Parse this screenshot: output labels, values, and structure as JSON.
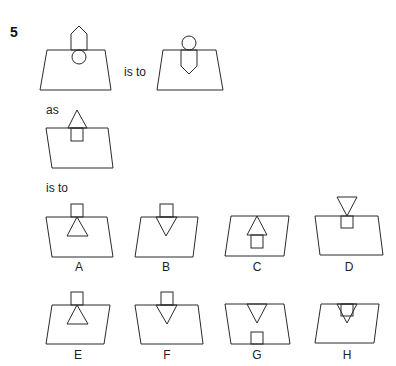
{
  "question": {
    "number": "5",
    "connector_1": "is to",
    "connector_2": "as",
    "connector_3": "is to"
  },
  "figures": {
    "figure_1": {
      "description": "trapezoid with pentagon arrow pointing up above the top edge and circle just below top edge"
    },
    "figure_2": {
      "description": "trapezoid with circle above the top edge and pentagon arrow pointing down below the top edge"
    },
    "figure_3": {
      "description": "parallelogram with triangle above the top edge and square below the top edge"
    }
  },
  "options": [
    {
      "letter": "A"
    },
    {
      "letter": "B"
    },
    {
      "letter": "C"
    },
    {
      "letter": "D"
    },
    {
      "letter": "E"
    },
    {
      "letter": "F"
    },
    {
      "letter": "G"
    },
    {
      "letter": "H"
    }
  ]
}
